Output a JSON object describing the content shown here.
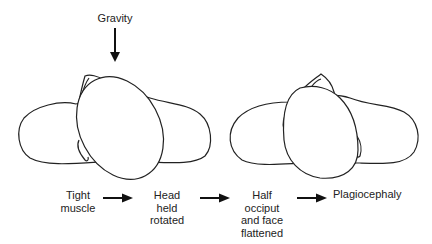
{
  "diagram": {
    "force_label": "Gravity",
    "steps": [
      {
        "lines": [
          "Tight",
          "muscle"
        ]
      },
      {
        "lines": [
          "Head",
          "held",
          "rotated"
        ]
      },
      {
        "lines": [
          "Half",
          "occiput",
          "and face",
          "flattened"
        ]
      },
      {
        "lines": [
          "Plagiocephaly"
        ]
      }
    ],
    "figures": [
      {
        "name": "infant-head-rotated",
        "description": "Top view of infant shoulders with head rotated (round head)"
      },
      {
        "name": "infant-head-flattened",
        "description": "Top view of infant shoulders with flattened head (plagiocephaly)"
      }
    ],
    "colors": {
      "line": "#222222",
      "background": "#ffffff"
    }
  }
}
